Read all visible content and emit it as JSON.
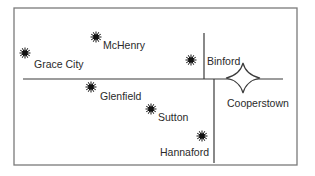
{
  "map": {
    "frame": {
      "x": 14,
      "y": 8,
      "width": 283,
      "height": 157,
      "color": "#7a7a7a"
    },
    "roads": [
      {
        "name": "main-east-west-road",
        "x1": 23,
        "y1": 79,
        "x2": 283,
        "y2": 79
      },
      {
        "name": "north-road",
        "x1": 204,
        "y1": 33,
        "x2": 204,
        "y2": 79
      },
      {
        "name": "south-road",
        "x1": 214,
        "y1": 79,
        "x2": 214,
        "y2": 163
      }
    ],
    "towns": [
      {
        "name": "McHenry",
        "icon": "burst-icon",
        "marker": {
          "x": 96,
          "y": 37
        },
        "label_pos": {
          "x": 103,
          "y": 40
        }
      },
      {
        "name": "Grace City",
        "icon": "burst-icon",
        "marker": {
          "x": 25,
          "y": 53
        },
        "label_pos": {
          "x": 34,
          "y": 59
        }
      },
      {
        "name": "Binford",
        "icon": "burst-icon",
        "marker": {
          "x": 191,
          "y": 60
        },
        "label_pos": {
          "x": 207,
          "y": 56
        }
      },
      {
        "name": "Glenfield",
        "icon": "burst-icon",
        "marker": {
          "x": 91,
          "y": 87
        },
        "label_pos": {
          "x": 100,
          "y": 91
        }
      },
      {
        "name": "Sutton",
        "icon": "burst-icon",
        "marker": {
          "x": 151,
          "y": 109
        },
        "label_pos": {
          "x": 158,
          "y": 112
        }
      },
      {
        "name": "Hannaford",
        "icon": "burst-icon",
        "marker": {
          "x": 202,
          "y": 136
        },
        "label_pos": {
          "x": 160,
          "y": 147
        }
      }
    ],
    "capital": {
      "name": "Cooperstown",
      "icon": "four-point-star-icon",
      "marker": {
        "x": 243,
        "y": 78
      },
      "label_pos": {
        "x": 227,
        "y": 98
      }
    },
    "colors": {
      "line": "#3a3a3a",
      "marker": "#111111",
      "star_fill": "#ffffff"
    }
  }
}
